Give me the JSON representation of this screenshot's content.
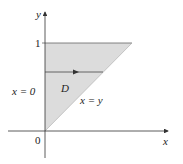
{
  "diagram": {
    "type": "region-of-integration",
    "axes": {
      "x_label": "x",
      "y_label": "y",
      "origin_label": "0",
      "y_tick_label": "1"
    },
    "region": {
      "label": "D",
      "fill_color": "#dcdcdc",
      "vertices": [
        [
          0,
          0
        ],
        [
          0,
          1
        ],
        [
          1,
          1
        ]
      ]
    },
    "boundaries": {
      "left": "x = 0",
      "diagonal": "x = y"
    },
    "arrow": {
      "direction": "horizontal",
      "description": "horizontal strip from x = 0 to x = y"
    }
  }
}
